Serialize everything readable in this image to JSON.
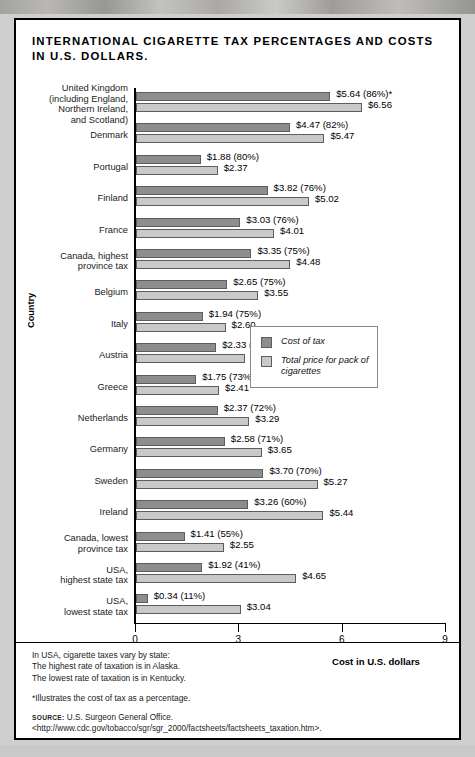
{
  "figure": {
    "title": "INTERNATIONAL CIGARETTE TAX PERCENTAGES AND COSTS IN U.S. DOLLARS.",
    "notes": [
      "In USA, cigarette taxes vary by state:",
      "The highest rate of taxation is in Alaska.",
      "The lowest rate of taxation is in Kentucky."
    ],
    "footnote": "*Illustrates the cost of tax as a percentage.",
    "source_tag": "SOURCE:",
    "source_text": "U.S. Surgeon General Office. <http://www.cdc.gov/tobacco/sgr/sgr_2000/factsheets/factsheets_taxation.htm>."
  },
  "legend": {
    "items": [
      {
        "key": "tax",
        "label": "Cost of tax",
        "color": "#8d8d8d"
      },
      {
        "key": "total",
        "label": "Total price for pack of cigarettes",
        "color": "#c9c9c9"
      }
    ]
  },
  "chart_data": {
    "type": "bar",
    "orientation": "horizontal",
    "title": "INTERNATIONAL CIGARETTE TAX PERCENTAGES AND COSTS IN U.S. DOLLARS.",
    "xlabel": "Cost in U.S. dollars",
    "ylabel": "Country",
    "xlim": [
      0,
      9
    ],
    "xticks": [
      0,
      3,
      6,
      9
    ],
    "xticklabels": [
      "0",
      "3",
      "6",
      "9"
    ],
    "grid": false,
    "legend_position": "middle-right",
    "series": [
      {
        "name": "Cost of tax",
        "color": "#8d8d8d",
        "values": [
          5.64,
          4.47,
          1.88,
          3.82,
          3.03,
          3.35,
          2.65,
          1.94,
          2.33,
          1.75,
          2.37,
          2.58,
          3.7,
          3.26,
          1.41,
          1.92,
          0.34
        ]
      },
      {
        "name": "Total price for pack of cigarettes",
        "color": "#c9c9c9",
        "values": [
          6.56,
          5.47,
          2.37,
          5.02,
          4.01,
          4.48,
          3.55,
          2.6,
          3.15,
          2.41,
          3.29,
          3.65,
          5.27,
          5.44,
          2.55,
          4.65,
          3.04
        ]
      }
    ],
    "categories": [
      "United Kingdom (including England, Northern Ireland, and Scotland)",
      "Denmark",
      "Portugal",
      "Finland",
      "France",
      "Canada, highest province tax",
      "Belgium",
      "Italy",
      "Austria",
      "Greece",
      "Netherlands",
      "Germany",
      "Sweden",
      "Ireland",
      "Canada, lowest province tax",
      "USA, highest state tax",
      "USA, lowest state tax"
    ],
    "tax_percentages": [
      86,
      82,
      80,
      76,
      76,
      75,
      75,
      75,
      74,
      73,
      72,
      71,
      70,
      60,
      55,
      41,
      11
    ],
    "rows": [
      {
        "label_lines": [
          "United Kingdom",
          "(including England,",
          "Northern Ireland,",
          "and Scotland)"
        ],
        "tax": 5.64,
        "total": 6.56,
        "pct": 86,
        "tax_label": "$5.64  (86%)*",
        "total_label": "$6.56"
      },
      {
        "label_lines": [
          "Denmark"
        ],
        "tax": 4.47,
        "total": 5.47,
        "pct": 82,
        "tax_label": "$4.47  (82%)",
        "total_label": "$5.47"
      },
      {
        "label_lines": [
          "Portugal"
        ],
        "tax": 1.88,
        "total": 2.37,
        "pct": 80,
        "tax_label": "$1.88  (80%)",
        "total_label": "$2.37"
      },
      {
        "label_lines": [
          "Finland"
        ],
        "tax": 3.82,
        "total": 5.02,
        "pct": 76,
        "tax_label": "$3.82  (76%)",
        "total_label": "$5.02"
      },
      {
        "label_lines": [
          "France"
        ],
        "tax": 3.03,
        "total": 4.01,
        "pct": 76,
        "tax_label": "$3.03  (76%)",
        "total_label": "$4.01"
      },
      {
        "label_lines": [
          "Canada, highest",
          "province tax"
        ],
        "tax": 3.35,
        "total": 4.48,
        "pct": 75,
        "tax_label": "$3.35  (75%)",
        "total_label": "$4.48"
      },
      {
        "label_lines": [
          "Belgium"
        ],
        "tax": 2.65,
        "total": 3.55,
        "pct": 75,
        "tax_label": "$2.65  (75%)",
        "total_label": "$3.55"
      },
      {
        "label_lines": [
          "Italy"
        ],
        "tax": 1.94,
        "total": 2.6,
        "pct": 75,
        "tax_label": "$1.94  (75%)",
        "total_label": "$2.60"
      },
      {
        "label_lines": [
          "Austria"
        ],
        "tax": 2.33,
        "total": 3.15,
        "pct": 74,
        "tax_label": "$2.33  (74%)",
        "total_label": "$3.15"
      },
      {
        "label_lines": [
          "Greece"
        ],
        "tax": 1.75,
        "total": 2.41,
        "pct": 73,
        "tax_label": "$1.75  (73%)",
        "total_label": "$2.41"
      },
      {
        "label_lines": [
          "Netherlands"
        ],
        "tax": 2.37,
        "total": 3.29,
        "pct": 72,
        "tax_label": "$2.37  (72%)",
        "total_label": "$3.29"
      },
      {
        "label_lines": [
          "Germany"
        ],
        "tax": 2.58,
        "total": 3.65,
        "pct": 71,
        "tax_label": "$2.58  (71%)",
        "total_label": "$3.65"
      },
      {
        "label_lines": [
          "Sweden"
        ],
        "tax": 3.7,
        "total": 5.27,
        "pct": 70,
        "tax_label": "$3.70  (70%)",
        "total_label": "$5.27"
      },
      {
        "label_lines": [
          "Ireland"
        ],
        "tax": 3.26,
        "total": 5.44,
        "pct": 60,
        "tax_label": "$3.26  (60%)",
        "total_label": "$5.44"
      },
      {
        "label_lines": [
          "Canada, lowest",
          "province tax"
        ],
        "tax": 1.41,
        "total": 2.55,
        "pct": 55,
        "tax_label": "$1.41  (55%)",
        "total_label": "$2.55"
      },
      {
        "label_lines": [
          "USA,",
          "highest state tax"
        ],
        "tax": 1.92,
        "total": 4.65,
        "pct": 41,
        "tax_label": "$1.92  (41%)",
        "total_label": "$4.65"
      },
      {
        "label_lines": [
          "USA,",
          "lowest state tax"
        ],
        "tax": 0.34,
        "total": 3.04,
        "pct": 11,
        "tax_label": "$0.34  (11%)",
        "total_label": "$3.04"
      }
    ]
  }
}
